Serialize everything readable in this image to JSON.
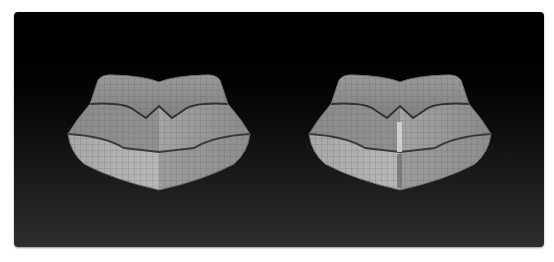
{
  "viewport": {
    "description": "3D modeling viewport showing two lip mesh comparisons",
    "background_top": "#000000",
    "background_bottom": "#2e2e2e"
  },
  "models": [
    {
      "id": "left",
      "label": "",
      "base_color": "#8a8a8a",
      "highlight_color": "#b5b5b5",
      "edge_loop_color": "#3a3a3a",
      "center_strip": false
    },
    {
      "id": "right",
      "label": "",
      "base_color": "#8a8a8a",
      "highlight_color": "#b5b5b5",
      "edge_loop_color": "#3a3a3a",
      "center_strip": true,
      "center_strip_color": "#d0d0d0"
    }
  ]
}
